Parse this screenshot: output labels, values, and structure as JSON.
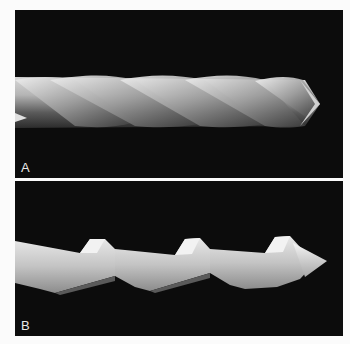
{
  "figure": {
    "panels": [
      {
        "id": "A",
        "label": "A",
        "subject": "twisted spiral instrument, smooth helical flutes",
        "background": "#0c0c0c"
      },
      {
        "id": "B",
        "label": "B",
        "subject": "instrument with stepped helical cutting edges and conical tip",
        "background": "#0c0c0c"
      }
    ],
    "colors": {
      "page": "#fbfbfb",
      "metal_light": "#e6e6e6",
      "metal_mid": "#9a9a9a",
      "metal_dark": "#3a3a3a"
    }
  }
}
